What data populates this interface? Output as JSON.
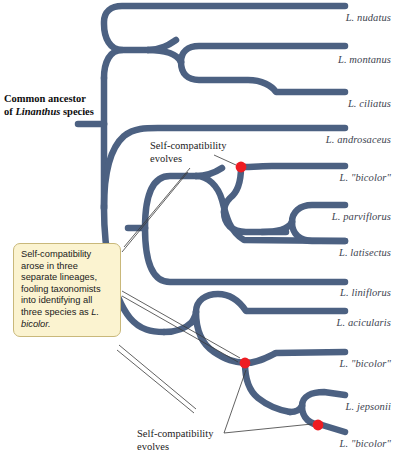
{
  "figure": {
    "type": "phylogenetic-tree",
    "root_label_html": "Common ancestor of <i>Linanthus</i> species",
    "root_label_text": "Common ancestor of Linanthus species",
    "branch_color": "#4c6182",
    "marker_color": "#ee1c22",
    "callout_fill": "#fbf3d0",
    "callout_border": "#c9b87a",
    "label_color": "#3d4450"
  },
  "tips": [
    {
      "label": "L. nudatus",
      "y": 6
    },
    {
      "label": "L. montanus",
      "y": 48
    },
    {
      "label": "L. ciliatus",
      "y": 92
    },
    {
      "label": "L. androsaceus",
      "y": 128
    },
    {
      "label": "L. \"bicolor\"",
      "y": 166
    },
    {
      "label": "L. parviflorus",
      "y": 205
    },
    {
      "label": "L. latisectus",
      "y": 241
    },
    {
      "label": "L. liniflorus",
      "y": 281
    },
    {
      "label": "L. acicularis",
      "y": 311
    },
    {
      "label": "L. \"bicolor\"",
      "y": 352
    },
    {
      "label": "L. jepsonii",
      "y": 395
    },
    {
      "label": "L. \"bicolor\"",
      "y": 432
    }
  ],
  "annotations": {
    "evolve_top": {
      "line1": "Self-compatibility",
      "line2": "evolves"
    },
    "evolve_bottom": {
      "line1": "Self-compatibility",
      "line2": "evolves"
    },
    "callout_html": "Self-compatibility arose in three separate lineages, fooling taxonomists into identifying all three species as <i>L. bicolor.</i>",
    "callout_text": "Self-compatibility arose in three separate lineages, fooling taxonomists into identifying all three species as L. bicolor."
  },
  "markers": [
    {
      "name": "self-compatibility-marker-1",
      "x": 241,
      "y": 167
    },
    {
      "name": "self-compatibility-marker-2",
      "x": 245,
      "y": 363
    },
    {
      "name": "self-compatibility-marker-3",
      "x": 318,
      "y": 425
    }
  ],
  "chart_data": {
    "type": "tree",
    "tip_count": 12,
    "self_compatible_tips": [
      "L. \"bicolor\" (clade A)",
      "L. \"bicolor\" (clade B)",
      "L. \"bicolor\" (clade C)"
    ]
  }
}
